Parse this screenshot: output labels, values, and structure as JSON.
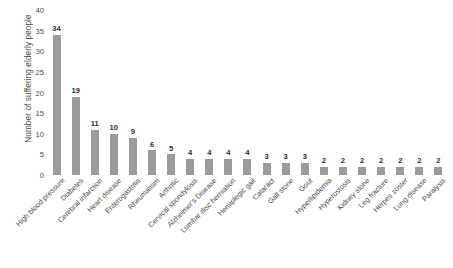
{
  "chart_data": {
    "type": "bar",
    "title": "",
    "subtitle": "",
    "xlabel": "",
    "ylabel": "Number of suffering elderly people",
    "ylim": [
      0,
      40
    ],
    "ytick_step": 5,
    "yticks": [
      0,
      5,
      10,
      15,
      20,
      25,
      30,
      35,
      40
    ],
    "grid": false,
    "legend": false,
    "legend_position": "none",
    "bar_color": "#9b9b9b",
    "value_labels_shown": true,
    "categories": [
      "High blood pressure",
      "Diabetes",
      "Cerebral infarction",
      "Heart disease",
      "Enterogastritis",
      "Rheumatism",
      "Arthritic",
      "Cervical spondylosis",
      "Alzheimer's Disease",
      "Lumbar disc herniation",
      "Hemiplegic gait",
      "Cataract",
      "Gall stone",
      "Gout",
      "Hyperlipidemia",
      "Hyperostosis",
      "Kidney stone",
      "Leg fracture",
      "Herpes zoster",
      "Lung disease",
      "Paralysis"
    ],
    "values": [
      34,
      19,
      11,
      10,
      9,
      6,
      5,
      4,
      4,
      4,
      4,
      3,
      3,
      3,
      2,
      2,
      2,
      2,
      2,
      2,
      2
    ]
  }
}
